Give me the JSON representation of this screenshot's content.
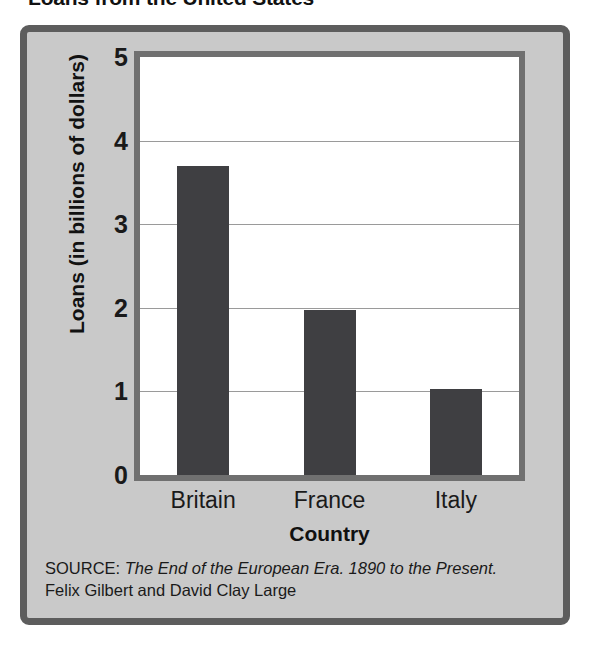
{
  "chart_data": {
    "type": "bar",
    "title": "Loans from the United States",
    "categories": [
      "Britain",
      "France",
      "Italy"
    ],
    "values": [
      3.7,
      1.97,
      1.03
    ],
    "xlabel": "Country",
    "ylabel": "Loans (in billions of dollars)",
    "ylim": [
      0,
      5
    ],
    "ytick_labels": [
      "0",
      "1",
      "2",
      "3",
      "4",
      "5"
    ],
    "ytick_values": [
      0,
      1,
      2,
      3,
      4,
      5
    ],
    "grid": true,
    "gridlines_at": [
      1,
      2,
      3,
      4
    ],
    "legend": null,
    "bar_color": "#3f3f42",
    "plot_background": "#ffffff",
    "panel_background": "#c9c9c9",
    "frame_color": "#5d5d5d"
  },
  "source": {
    "prefix": "SOURCE: ",
    "work": "The End of the European Era. 1890 to the Present.",
    "authors": "Felix Gilbert and David Clay Large"
  }
}
